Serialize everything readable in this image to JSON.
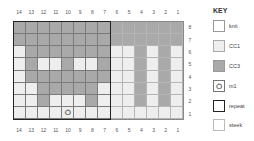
{
  "chart": {
    "columns": [
      "14",
      "13",
      "12",
      "11",
      "10",
      "9",
      "8",
      "7",
      "6",
      "5",
      "4",
      "3",
      "2",
      "1"
    ],
    "rows_top_to_bottom": [
      "8",
      "7",
      "6",
      "5",
      "4",
      "3",
      "2",
      "1"
    ],
    "cells": [
      [
        "cc3",
        "cc3",
        "cc3",
        "cc3",
        "cc3",
        "cc3",
        "cc3",
        "cc3",
        "cc3",
        "cc3",
        "cc3",
        "cc3",
        "cc3",
        "cc3"
      ],
      [
        "cc3",
        "cc3",
        "cc3",
        "cc3",
        "cc3",
        "cc3",
        "cc3",
        "cc3",
        "cc3",
        "cc3",
        "cc3",
        "cc3",
        "cc3",
        "cc3"
      ],
      [
        "cc1",
        "cc3",
        "cc3",
        "cc3",
        "cc3",
        "cc3",
        "cc3",
        "cc3",
        "cc1",
        "cc1",
        "cc3",
        "cc1",
        "cc3",
        "cc1"
      ],
      [
        "cc1",
        "cc3",
        "cc1",
        "cc1",
        "cc3",
        "cc1",
        "cc1",
        "cc3",
        "cc1",
        "cc1",
        "cc3",
        "cc1",
        "cc3",
        "cc1"
      ],
      [
        "cc1",
        "cc3",
        "cc3",
        "cc3",
        "cc3",
        "cc3",
        "cc3",
        "cc3",
        "cc1",
        "cc1",
        "cc3",
        "cc1",
        "cc3",
        "cc1"
      ],
      [
        "cc1",
        "cc1",
        "cc3",
        "cc3",
        "cc3",
        "cc3",
        "cc3",
        "cc1",
        "cc1",
        "cc1",
        "cc3",
        "cc1",
        "cc3",
        "cc1"
      ],
      [
        "cc1",
        "cc1",
        "cc3",
        "cc1",
        "cc1",
        "cc1",
        "cc3",
        "cc1",
        "cc1",
        "cc1",
        "cc3",
        "cc1",
        "cc3",
        "cc1"
      ],
      [
        "cc1",
        "cc1",
        "cc1",
        "cc1",
        "m1",
        "cc1",
        "cc1",
        "cc1",
        "cc1",
        "cc1",
        "cc1",
        "cc1",
        "cc1",
        "cc1"
      ]
    ],
    "repeat_columns": "14-7",
    "steek_columns": "6-1",
    "m1_symbol": "Ö",
    "colors": {
      "cc1": "#eeeeee",
      "cc3": "#a9a9a9",
      "knit": "#ffffff",
      "grid": "#7a7a7a",
      "repeat_border": "#222222"
    }
  },
  "key": {
    "title": "KEY",
    "items": [
      {
        "label": "knit",
        "symbol": ""
      },
      {
        "label": "CC1",
        "symbol": ""
      },
      {
        "label": "CC3",
        "symbol": ""
      },
      {
        "label": "m1",
        "symbol": "Ö"
      },
      {
        "label": "repeat",
        "symbol": ""
      },
      {
        "label": "steek",
        "symbol": ""
      }
    ]
  }
}
